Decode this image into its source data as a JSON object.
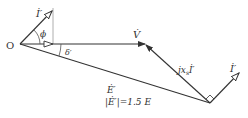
{
  "diagram": {
    "type": "phasor-diagram",
    "origin_label": "O",
    "vectors": [
      {
        "id": "I_prime_left",
        "label": "İ′",
        "from": [
          20,
          44
        ],
        "to": [
          53,
          10
        ],
        "arrow": "open"
      },
      {
        "id": "V",
        "label": "V̇",
        "from": [
          20,
          44
        ],
        "to": [
          145,
          44
        ],
        "arrow": "filled"
      },
      {
        "id": "E_prime",
        "label": "Ė′",
        "from": [
          20,
          44
        ],
        "to": [
          210,
          103
        ],
        "arrow": "none"
      },
      {
        "id": "jxs_I",
        "label": "jxₛİ′",
        "from": [
          210,
          103
        ],
        "to": [
          145,
          44
        ],
        "arrow": "filled"
      },
      {
        "id": "I_prime_right",
        "label": "İ′",
        "from": [
          210,
          103
        ],
        "to": [
          240,
          72
        ],
        "arrow": "open"
      }
    ],
    "angles": [
      {
        "label": "ϕ",
        "between": [
          "I_prime_left",
          "V"
        ]
      },
      {
        "label": "δ′",
        "between": [
          "V",
          "E_prime"
        ]
      }
    ],
    "annotations": {
      "E_label": "Ė′",
      "E_magnitude": "|Ė′|=1.5 E"
    }
  },
  "labels": {
    "O": "O",
    "I_left": "İ′",
    "phi": "ϕ",
    "delta": "δ′",
    "V": "V̇",
    "jxs_prefix": "jx",
    "jxs_sub": "s",
    "jxs_I": "İ′",
    "I_right": "İ′",
    "E": "Ė′",
    "E_mag": "|Ė′|=1.5 E"
  }
}
